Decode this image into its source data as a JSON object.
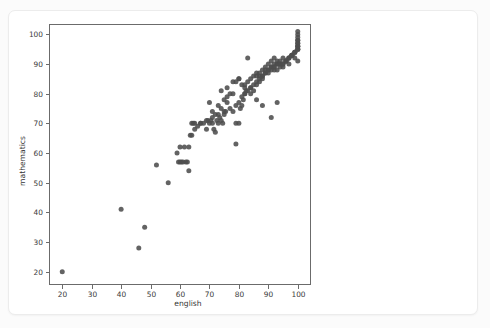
{
  "chart_data": {
    "type": "scatter",
    "title": "",
    "xlabel": "english",
    "ylabel": "mathematics",
    "xlim": [
      15.5,
      104.5
    ],
    "ylim": [
      15.5,
      103.5
    ],
    "xticks": [
      20,
      30,
      40,
      50,
      60,
      70,
      80,
      90,
      100
    ],
    "yticks": [
      20,
      30,
      40,
      50,
      60,
      70,
      80,
      90,
      100
    ],
    "xtick_labels": [
      "20",
      "30",
      "40",
      "50",
      "60",
      "70",
      "80",
      "90",
      "100"
    ],
    "ytick_labels": [
      "20",
      "30",
      "40",
      "50",
      "60",
      "70",
      "80",
      "90",
      "100"
    ],
    "grid": false,
    "legend": null,
    "marker_color": "#4d4d4d",
    "marker_size": 5,
    "series": [
      {
        "name": "students",
        "x": [
          20,
          40,
          46,
          48,
          52,
          56,
          59,
          59.5,
          60,
          60,
          60.5,
          61,
          61.5,
          62,
          62.5,
          63,
          63.5,
          64,
          64.5,
          63,
          64,
          65,
          66,
          67,
          68,
          69,
          69.5,
          70,
          70.5,
          71,
          71.5,
          72,
          72.5,
          73,
          73.5,
          74,
          74.5,
          75,
          75.5,
          76,
          70,
          71,
          72,
          73,
          74,
          75,
          76,
          77,
          78,
          79,
          79,
          80,
          80.5,
          81,
          81.5,
          82,
          82.5,
          83,
          78,
          79,
          80,
          81,
          82,
          83,
          84,
          85,
          86,
          79,
          80,
          81,
          82,
          83,
          84,
          85,
          86,
          87,
          88,
          84,
          85,
          86,
          87,
          88,
          89,
          90,
          91,
          92,
          86,
          87,
          88,
          89,
          90,
          91,
          92,
          93,
          87,
          88,
          89,
          90,
          91,
          92,
          93,
          94,
          95,
          89,
          90,
          91,
          92,
          93,
          94,
          95,
          96,
          97,
          92,
          93,
          94,
          95,
          96,
          97,
          98,
          99,
          100,
          94,
          95,
          96,
          97,
          98,
          99,
          100,
          100,
          100,
          96,
          97,
          98,
          99,
          100,
          100,
          100,
          100,
          100,
          98,
          99,
          100,
          100,
          100,
          100,
          100,
          93,
          91,
          88,
          86,
          84,
          82,
          80,
          78,
          76,
          74,
          77,
          75,
          73,
          71,
          69,
          67,
          65
        ],
        "y": [
          20,
          41,
          28,
          35,
          56,
          50,
          60,
          57,
          57,
          62,
          57,
          57,
          62,
          57,
          57,
          54,
          66,
          70,
          70,
          62,
          66,
          68,
          69,
          70,
          70,
          68,
          71,
          70,
          71,
          70,
          68,
          67,
          71,
          70,
          72,
          71,
          70,
          73,
          74,
          77,
          77,
          74,
          73,
          76,
          75,
          78,
          79,
          80,
          80,
          63,
          70,
          70,
          75,
          76,
          78,
          80,
          81,
          92,
          74,
          76,
          77,
          79,
          80,
          81,
          82,
          83,
          84,
          84,
          85,
          83,
          82,
          84,
          85,
          86,
          87,
          86,
          85,
          80,
          81,
          83,
          84,
          86,
          87,
          88,
          89,
          88,
          86,
          87,
          88,
          89,
          90,
          91,
          92,
          90,
          85,
          86,
          87,
          88,
          89,
          90,
          91,
          90,
          89,
          88,
          87,
          88,
          89,
          90,
          91,
          92,
          91,
          90,
          89,
          88,
          89,
          90,
          91,
          92,
          93,
          92,
          91,
          90,
          90,
          91,
          92,
          93,
          94,
          95,
          96,
          97,
          91,
          92,
          93,
          94,
          95,
          96,
          97,
          98,
          99,
          93,
          94,
          95,
          96,
          98,
          100,
          101,
          77,
          72,
          76,
          78,
          82,
          83,
          85,
          84,
          82,
          81,
          75,
          74,
          73,
          72,
          71,
          70,
          70
        ]
      }
    ]
  },
  "axis": {
    "xlabel": "english",
    "ylabel": "mathematics"
  }
}
